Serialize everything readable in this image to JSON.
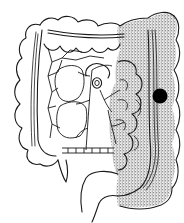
{
  "figure": {
    "background_color": "#ffffff",
    "line_color": "#1a1a1a",
    "stipple_color": "#3a3a3a",
    "regions": [
      {
        "name": "ascending-colon",
        "shaded": false
      },
      {
        "name": "transverse-colon",
        "shaded": false,
        "partially_shaded_left_third": true
      },
      {
        "name": "descending-colon",
        "shaded": true
      },
      {
        "name": "sigmoid-colon",
        "shaded": true
      },
      {
        "name": "rectum",
        "shaded": false
      }
    ],
    "marker": {
      "name": "lesion-marker",
      "cx": 160,
      "cy": 96,
      "r": 7.5,
      "color": "#000000"
    }
  }
}
